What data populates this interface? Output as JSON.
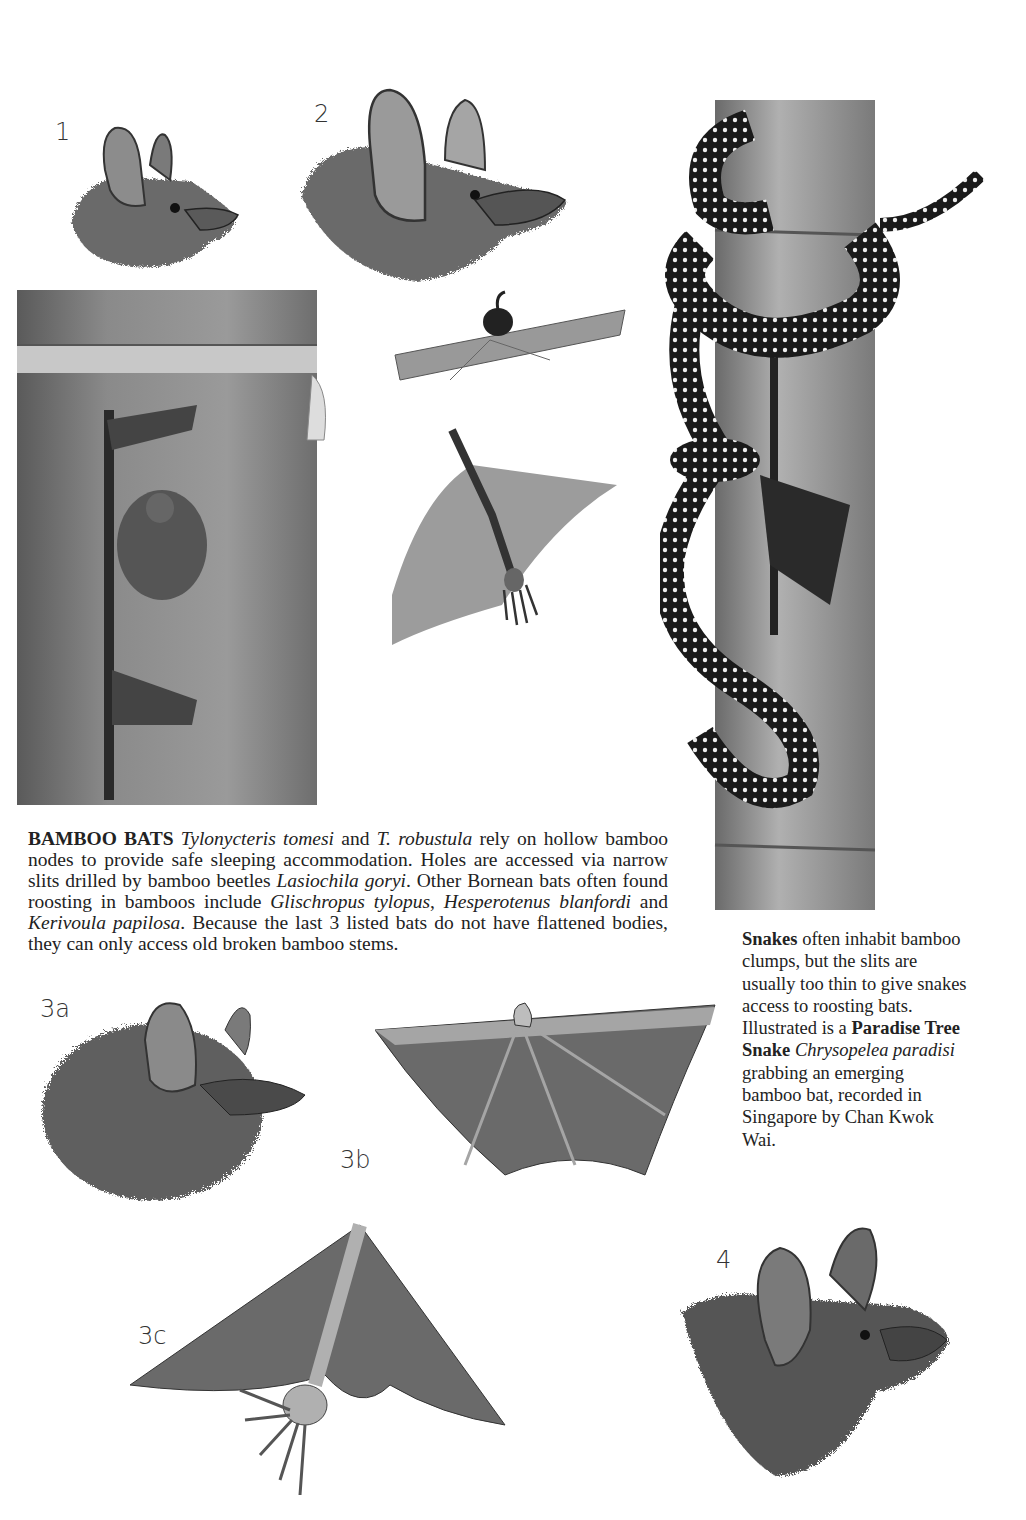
{
  "page": {
    "background": "#ffffff"
  },
  "figures": [
    {
      "id": "fig-1",
      "label": "1",
      "description": "bat head profile, small rounded ears"
    },
    {
      "id": "fig-2",
      "label": "2",
      "description": "bat head profile, large pointed ears"
    },
    {
      "id": "fig-bamboo-stem",
      "label": "",
      "description": "bamboo stem with bat emerging from slit"
    },
    {
      "id": "fig-thumb-pad",
      "label": "",
      "description": "wing edge with thumb pad detail"
    },
    {
      "id": "fig-foot-pad",
      "label": "",
      "description": "wing membrane with foot pad detail"
    },
    {
      "id": "fig-snake",
      "label": "",
      "description": "Paradise Tree Snake coiled around bamboo grabbing bat"
    },
    {
      "id": "fig-3a",
      "label": "3a",
      "description": "furry bat head"
    },
    {
      "id": "fig-3b",
      "label": "3b",
      "description": "bat wing with thumb"
    },
    {
      "id": "fig-3c",
      "label": "3c",
      "description": "bat wing with foot"
    },
    {
      "id": "fig-4",
      "label": "4",
      "description": "bat head with rounded ears"
    }
  ],
  "main_caption": {
    "heading": "BAMBOO BATS",
    "segments": [
      {
        "text": "Tylonycteris tomesi",
        "style": "italic"
      },
      {
        "text": " and ",
        "style": "normal"
      },
      {
        "text": "T. robustula",
        "style": "italic"
      },
      {
        "text": " rely on hollow bamboo nodes to provide safe sleeping accommodation. Holes are accessed via narrow slits drilled by bamboo beetles ",
        "style": "normal"
      },
      {
        "text": "Lasiochila goryi",
        "style": "italic"
      },
      {
        "text": ". Other Bornean bats often found roosting in bamboos include ",
        "style": "normal"
      },
      {
        "text": "Glischropus tylopus",
        "style": "italic"
      },
      {
        "text": ", ",
        "style": "normal"
      },
      {
        "text": "Hesperotenus blanfordi",
        "style": "italic"
      },
      {
        "text": " and ",
        "style": "normal"
      },
      {
        "text": "Kerivoula papilosa",
        "style": "italic"
      },
      {
        "text": ". Because the last 3 listed bats do not have flattened bodies, they can only access old broken bamboo stems.",
        "style": "normal"
      }
    ]
  },
  "side_caption": {
    "heading": "Snakes",
    "segments": [
      {
        "text": " often inhabit bamboo clumps, but the slits are usually too thin to give snakes access to roosting bats. Illustrated is a ",
        "style": "normal"
      },
      {
        "text": "Paradise Tree Snake",
        "style": "bold"
      },
      {
        "text": " ",
        "style": "normal"
      },
      {
        "text": "Chrysopelea paradisi",
        "style": "italic"
      },
      {
        "text": " grabbing an emerging bamboo bat, recorded in Singapore by Chan Kwok Wai.",
        "style": "normal"
      }
    ]
  }
}
